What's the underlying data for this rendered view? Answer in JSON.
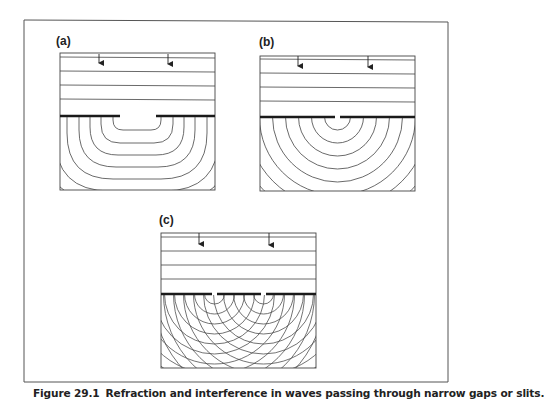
{
  "figure": {
    "number": "Figure 29.1",
    "caption": "Refraction and interference in waves passing through narrow gaps or slits.",
    "colors": {
      "line": "#333333",
      "barrier": "#1a1a1a",
      "frame": "#555555",
      "background": "#ffffff"
    },
    "panels": [
      {
        "id": "a",
        "label": "(a)",
        "description": "Plane waves passing through a wide gap spread slightly",
        "slits": 1,
        "gap": "wide"
      },
      {
        "id": "b",
        "label": "(b)",
        "description": "Plane waves passing through a narrow gap produce circular wavefronts",
        "slits": 1,
        "gap": "narrow"
      },
      {
        "id": "c",
        "label": "(c)",
        "description": "Plane waves passing through two narrow slits produce overlapping circular wavefronts (interference)",
        "slits": 2,
        "gap": "narrow"
      }
    ],
    "incident_wavefronts": 4,
    "arrows_per_panel": 2
  }
}
